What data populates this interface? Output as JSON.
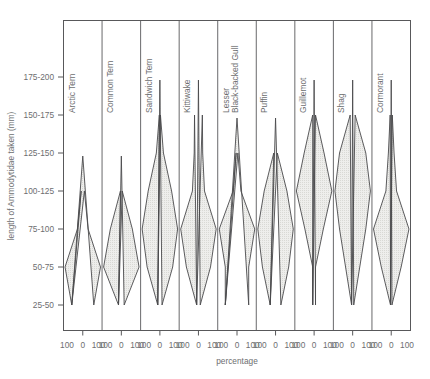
{
  "chart_data": {
    "type": "area",
    "title": "",
    "subtitle": "",
    "xlabel": "percentage",
    "ylabel": "length of Ammodytidae taken (mm)",
    "grid": false,
    "legend_position": "none",
    "panel_layout": "small-multiples, one vertical violin per species, mirrored horizontally about panel centre",
    "y_categories": [
      "25-50",
      "50-75",
      "75-100",
      "100-125",
      "125-150",
      "150-175",
      "175-200"
    ],
    "y_tick_labels_top_to_bottom": [
      "175-200",
      "150-175",
      "125-150",
      "100-125",
      "75-100",
      "50-75",
      "25-50"
    ],
    "x_tick_labels_per_panel": [
      "100",
      "0",
      "100"
    ],
    "x_range": [
      -100,
      100
    ],
    "x_units": "percentage",
    "accent_color": "#58585a",
    "violin_fill": "#e9e9e7",
    "violin_stroke": "#4a4a4c",
    "frame_color": "#58585a",
    "series": [
      {
        "name": "Arctic Tern",
        "label_lines": [
          "Arctic Tern"
        ],
        "values": [
          62,
          100,
          30,
          9,
          0,
          0,
          0
        ],
        "peak_category": "50-75",
        "top_category_reached": "100-125"
      },
      {
        "name": "Common Tern",
        "label_lines": [
          "Common Tern"
        ],
        "values": [
          16,
          100,
          62,
          5,
          0,
          0,
          0
        ],
        "peak_category": "50-75",
        "top_category_reached": "100-125"
      },
      {
        "name": "Sandwich Tern",
        "label_lines": [
          "Sandwich Tern"
        ],
        "values": [
          12,
          72,
          100,
          66,
          20,
          3,
          0
        ],
        "peak_category": "75-100",
        "top_category_reached": "150-175"
      },
      {
        "name": "Kittiwake",
        "label_lines": [
          "Kittiwake"
        ],
        "values": [
          10,
          68,
          100,
          34,
          24,
          22,
          0
        ],
        "peak_category": "75-100",
        "top_category_reached": "150-175"
      },
      {
        "name": "Lesser Black-backed Gull",
        "label_lines": [
          "Lesser",
          "Black-backed Gull"
        ],
        "values": [
          66,
          66,
          100,
          22,
          5,
          0,
          0
        ],
        "peak_category": "75-100",
        "top_category_reached": "150-175"
      },
      {
        "name": "Puffin",
        "label_lines": [
          "Puffin"
        ],
        "values": [
          30,
          74,
          100,
          64,
          10,
          0,
          0
        ],
        "peak_category": "75-100",
        "top_category_reached": "150-175"
      },
      {
        "name": "Guillemot",
        "label_lines": [
          "Guillemot"
        ],
        "values": [
          8,
          8,
          52,
          100,
          56,
          8,
          0
        ],
        "peak_category": "100-125",
        "top_category_reached": "150-175"
      },
      {
        "name": "Shag",
        "label_lines": [
          "Shag"
        ],
        "values": [
          6,
          40,
          74,
          100,
          74,
          14,
          0
        ],
        "peak_category": "100-125",
        "top_category_reached": "150-175"
      },
      {
        "name": "Cormorant",
        "label_lines": [
          "Cormorant"
        ],
        "values": [
          4,
          56,
          100,
          30,
          16,
          6,
          0
        ],
        "peak_category": "75-100",
        "top_category_reached": "150-175"
      }
    ]
  },
  "figure": {
    "xaxis_title": "percentage",
    "yaxis_title": "length of Ammodytidae taken (mm)"
  }
}
